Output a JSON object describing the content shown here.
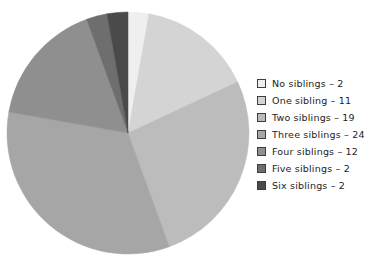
{
  "chart_data": {
    "type": "pie",
    "title": "",
    "subtitle": "",
    "xlabel": "",
    "ylabel": "",
    "total": 72,
    "start_angle_deg": 0,
    "direction": "clockwise",
    "legend_position": "right",
    "grid": false,
    "categories": [
      "No siblings",
      "One sibling",
      "Two siblings",
      "Three siblings",
      "Four siblings",
      "Five siblings",
      "Six siblings"
    ],
    "values": [
      2,
      11,
      19,
      24,
      12,
      2,
      2
    ],
    "colors": [
      "#efefef",
      "#d4d4d4",
      "#bcbcbc",
      "#a6a6a6",
      "#8f8f8f",
      "#6e6e6e",
      "#4a4a4a"
    ],
    "slices": [
      {
        "label": "No siblings",
        "value": 2,
        "color": "#efefef"
      },
      {
        "label": "One sibling",
        "value": 11,
        "color": "#d4d4d4"
      },
      {
        "label": "Two siblings",
        "value": 19,
        "color": "#bcbcbc"
      },
      {
        "label": "Three siblings",
        "value": 24,
        "color": "#a6a6a6"
      },
      {
        "label": "Four siblings",
        "value": 12,
        "color": "#8f8f8f"
      },
      {
        "label": "Five siblings",
        "value": 2,
        "color": "#6e6e6e"
      },
      {
        "label": "Six siblings",
        "value": 2,
        "color": "#4a4a4a"
      }
    ]
  },
  "legend": {
    "separator": "–",
    "entries": [
      {
        "label": "No siblings – 2",
        "color": "#efefef"
      },
      {
        "label": "One sibling – 11",
        "color": "#d4d4d4"
      },
      {
        "label": "Two siblings – 19",
        "color": "#bcbcbc"
      },
      {
        "label": "Three siblings – 24",
        "color": "#a6a6a6"
      },
      {
        "label": "Four siblings – 12",
        "color": "#8f8f8f"
      },
      {
        "label": "Five siblings – 2",
        "color": "#6e6e6e"
      },
      {
        "label": "Six siblings – 2",
        "color": "#4a4a4a"
      }
    ]
  },
  "geometry": {
    "center_x": 128,
    "center_y": 133,
    "radius": 121
  }
}
